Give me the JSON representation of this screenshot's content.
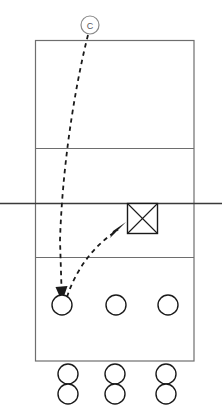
{
  "diagram": {
    "type": "volleyball-court-drill",
    "canvas": {
      "width": 222,
      "height": 419
    },
    "colors": {
      "background": "#ffffff",
      "court_line": "#6e6e6e",
      "net_line": "#3a3a3a",
      "motion_path": "#1a1a1a",
      "player_outline": "#1a1a1a",
      "coach_outline": "#8a8a8a"
    }
  },
  "court": {
    "name": "volleyball-court",
    "outline": {
      "x": 35,
      "y": 40,
      "width": 159,
      "height": 321
    },
    "lines": [
      {
        "name": "far-attack-line",
        "y": 148,
        "x1": 35,
        "x2": 194
      },
      {
        "name": "center-net-line",
        "y": 203,
        "x1": 0,
        "x2": 222
      },
      {
        "name": "near-attack-line",
        "y": 257,
        "x1": 35,
        "x2": 194
      }
    ]
  },
  "markers": {
    "coach": {
      "name": "coach-marker",
      "label": "C",
      "cx": 90,
      "cy": 25,
      "r": 9
    },
    "target": {
      "name": "target-box",
      "label": "X",
      "x": 127,
      "y": 203,
      "size": 31
    }
  },
  "players": {
    "on_court_row": {
      "name": "on-court-player-row",
      "cy": 305,
      "r": 10,
      "positions": [
        62,
        116,
        168
      ]
    },
    "waiting_rows": [
      {
        "name": "waiting-row-1",
        "cy": 374,
        "r": 10,
        "positions": [
          68,
          115,
          166
        ]
      },
      {
        "name": "waiting-row-2",
        "cy": 394,
        "r": 10,
        "positions": [
          68,
          115,
          166
        ]
      }
    ]
  },
  "paths": [
    {
      "name": "coach-toss-path",
      "style": "dashed",
      "arrow": "down",
      "description": "Ball tossed from coach down to front-left player",
      "d": "M 88 35 C 78 72, 62 150, 60 240 L 62 288",
      "arrow_points": "56,288 68,288 62,302"
    },
    {
      "name": "player-to-target-path",
      "style": "dashed",
      "arrow": "up-right",
      "description": "Ball passed from player up to target box near net",
      "d": "M 66 296 C 78 268, 96 243, 120 228",
      "arrow_points": "111,238 126,224 123,233 126,226"
    }
  ],
  "legend": {
    "coach_label": "C",
    "target_label": "X",
    "player_label": "O"
  }
}
